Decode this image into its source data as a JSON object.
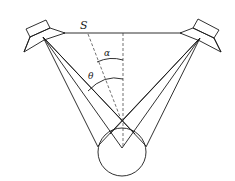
{
  "diagram": {
    "labels": {
      "baseline": "S",
      "angle_inner": "α",
      "angle_outer": "θ"
    },
    "nodes": [
      {
        "id": "left-speaker",
        "kind": "loudspeaker"
      },
      {
        "id": "right-speaker",
        "kind": "loudspeaker"
      },
      {
        "id": "listener-head",
        "kind": "circle"
      }
    ],
    "edges": [
      {
        "from": "left-speaker",
        "to": "right-speaker",
        "label": "S"
      },
      {
        "from": "left-speaker",
        "to": "listener-head"
      },
      {
        "from": "right-speaker",
        "to": "listener-head"
      }
    ],
    "colors": {
      "line": "#1a1a1a",
      "background": "#ffffff"
    }
  }
}
